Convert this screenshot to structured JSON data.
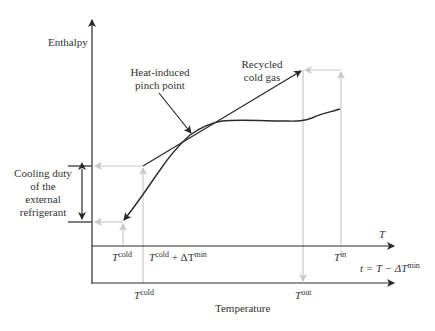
{
  "diagram": {
    "y_axis_label": "Enthalpy",
    "x_axis_label": "Temperature",
    "annotations": {
      "pinch_line1": "Heat-induced",
      "pinch_line2": "pinch point",
      "recycled_line1": "Recycled",
      "recycled_line2": "cold gas",
      "cooling_line1": "Cooling duty",
      "cooling_line2": "of the",
      "cooling_line3": "external",
      "cooling_line4": "refrigerant"
    },
    "upper_axis": {
      "name": "T",
      "ticks": [
        {
          "base": "T",
          "sup": "cold"
        },
        {
          "base": "T",
          "sup": "cold",
          "suffix": " + ΔT",
          "suffix_sup": "min"
        },
        {
          "base": "T",
          "sup": "in"
        }
      ]
    },
    "lower_axis": {
      "name_prefix": "t = T − ΔT",
      "name_sup": "min",
      "ticks": [
        {
          "base": "T",
          "sup": "cold"
        },
        {
          "base": "T",
          "sup": "out"
        }
      ]
    },
    "colors": {
      "line": "#2a2a2a",
      "guide": "#c8c8c8"
    }
  }
}
